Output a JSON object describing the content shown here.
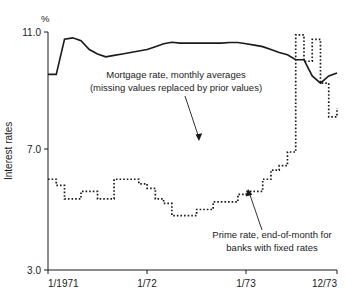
{
  "chart_data": {
    "type": "line",
    "title": "",
    "xlabel": "",
    "ylabel": "Interest rates",
    "yunit": "%",
    "ylim": [
      3.0,
      11.0
    ],
    "ytick_labels": [
      "11.0",
      "7.0",
      "3.0"
    ],
    "ytick_values": [
      11.0,
      7.0,
      3.0
    ],
    "xtick_labels": [
      "1/1971",
      "1/72",
      "1/73",
      "12/73"
    ],
    "xtick_values": [
      0,
      12,
      24,
      35
    ],
    "xlim": [
      0,
      35
    ],
    "grid": false,
    "legend_position": "inline-annotations",
    "x": [
      0,
      1,
      2,
      3,
      4,
      5,
      6,
      7,
      8,
      9,
      10,
      11,
      12,
      13,
      14,
      15,
      16,
      17,
      18,
      19,
      20,
      21,
      22,
      23,
      24,
      25,
      26,
      27,
      28,
      29,
      30,
      31,
      32,
      33,
      34,
      35
    ],
    "x_month_labels": [
      "1/1971",
      "2/1971",
      "3/1971",
      "4/1971",
      "5/1971",
      "6/1971",
      "7/1971",
      "8/1971",
      "9/1971",
      "10/1971",
      "11/1971",
      "12/1971",
      "1/1972",
      "2/1972",
      "3/1972",
      "4/1972",
      "5/1972",
      "6/1972",
      "7/1972",
      "8/1972",
      "9/1972",
      "10/1972",
      "11/1972",
      "12/1972",
      "1/1973",
      "2/1973",
      "3/1973",
      "4/1973",
      "5/1973",
      "6/1973",
      "7/1973",
      "8/1973",
      "9/1973",
      "10/1973",
      "11/1973",
      "12/1973"
    ],
    "series": [
      {
        "name": "Mortgage rate, monthly averages",
        "style": "solid",
        "values": [
          8.45,
          8.45,
          7.25,
          7.2,
          7.3,
          7.6,
          7.75,
          7.85,
          7.8,
          7.75,
          7.7,
          7.65,
          7.6,
          7.5,
          7.4,
          7.35,
          7.38,
          7.38,
          7.38,
          7.38,
          7.38,
          7.38,
          7.36,
          7.36,
          7.4,
          7.45,
          7.5,
          7.6,
          7.7,
          7.78,
          7.95,
          7.95,
          8.5,
          8.75,
          8.5,
          8.4
        ]
      },
      {
        "name": "Prime rate, end-of-month for banks with fixed rates",
        "style": "dotted",
        "values": [
          6.0,
          5.8,
          5.35,
          5.35,
          5.6,
          5.6,
          5.35,
          5.35,
          6.0,
          6.0,
          6.0,
          5.85,
          5.7,
          5.35,
          5.2,
          4.8,
          4.8,
          4.8,
          5.0,
          5.0,
          5.25,
          5.25,
          5.25,
          5.5,
          5.6,
          5.6,
          6.0,
          6.3,
          6.45,
          6.9,
          7.1,
          8.0,
          7.25,
          8.75,
          9.9,
          9.6
        ]
      }
    ],
    "annotations": [
      {
        "id": "mortgage-annotation",
        "lines": [
          "Mortgage rate, monthly averages",
          "(missing values replaced by prior values)"
        ],
        "target_x": 16.5,
        "target_y": 7.45
      },
      {
        "id": "prime-annotation",
        "lines": [
          "Prime rate, end-of-month for",
          "banks with fixed rates"
        ],
        "target_x": 25.0,
        "target_y": 5.75
      }
    ]
  }
}
